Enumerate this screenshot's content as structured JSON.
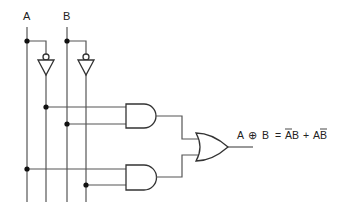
{
  "diagram": {
    "inputs": [
      {
        "id": "A",
        "label": "A"
      },
      {
        "id": "B",
        "label": "B"
      }
    ],
    "gates": [
      {
        "id": "not_a",
        "type": "NOT",
        "input": "A",
        "output": "A'"
      },
      {
        "id": "not_b",
        "type": "NOT",
        "input": "B",
        "output": "B'"
      },
      {
        "id": "and_1",
        "type": "AND",
        "inputs": [
          "A'",
          "B"
        ],
        "output": "A'B"
      },
      {
        "id": "and_2",
        "type": "AND",
        "inputs": [
          "A",
          "B'"
        ],
        "output": "AB'"
      },
      {
        "id": "or_1",
        "type": "OR",
        "inputs": [
          "A'B",
          "AB'"
        ],
        "output": "A XOR B"
      }
    ],
    "output": {
      "formula_lhs_a": "A",
      "formula_op": "⊕",
      "formula_lhs_b": "B",
      "formula_eq": "=",
      "term1_a": "A",
      "term1_b": "B",
      "formula_plus": "+",
      "term2_a": "A",
      "term2_b": "B",
      "formula_text": "A ⊕ B = ĀB + AB̄"
    },
    "colors": {
      "wire": "#555555",
      "gate_stroke": "#333333",
      "dot": "#111111",
      "background": "#ffffff"
    }
  }
}
